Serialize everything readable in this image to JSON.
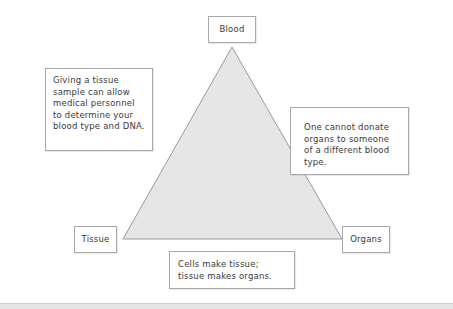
{
  "diagram": {
    "type": "triangle-relationship",
    "colors": {
      "triangle_fill": "#e6e6e6",
      "triangle_stroke": "#9a9a9a",
      "box_border": "#a8a8a8"
    },
    "vertices": {
      "top": "Blood",
      "bottom_left": "Tissue",
      "bottom_right": "Organs"
    },
    "edges": {
      "left": "Giving a tissue sample can allow medical personnel to determine your blood type and DNA.",
      "right": "One cannot donate organs to someone of a different blood type.",
      "bottom": "Cells make tissue; tissue makes organs."
    }
  }
}
